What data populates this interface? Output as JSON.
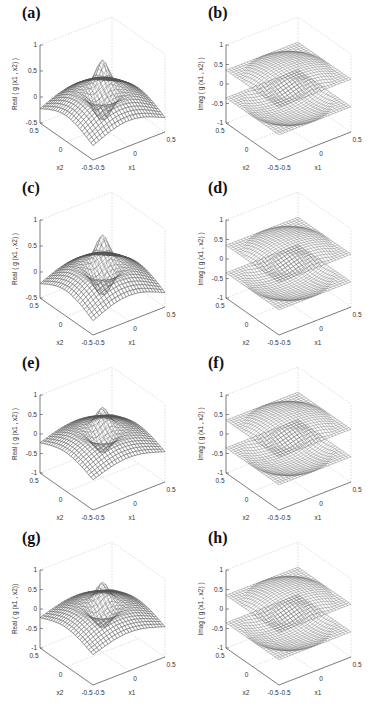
{
  "figure": {
    "panels": [
      {
        "id": "a",
        "label": "(a)",
        "zlabel": "Real ( g (x1 , x2) )",
        "kind": "real",
        "zticks": [
          "1",
          "0.5",
          "0",
          "-0.5"
        ],
        "zmin": -0.5,
        "zmax": 1,
        "x1label": "x1",
        "x2label": "x2",
        "x1ticks": [
          "-0.5",
          "0",
          "0.5"
        ],
        "x2ticks": [
          "0.5",
          "0",
          "-0.5"
        ]
      },
      {
        "id": "b",
        "label": "(b)",
        "zlabel": "Imag ( g (x1 , x2) )",
        "kind": "imag",
        "zticks": [
          "1",
          "0.5",
          "0",
          "-0.5",
          "-1"
        ],
        "zmin": -1,
        "zmax": 1,
        "x1label": "x1",
        "x2label": "x2",
        "x1ticks": [
          "-0.5",
          "0",
          "0.5"
        ],
        "x2ticks": [
          "0.5",
          "0",
          "-0.5"
        ]
      },
      {
        "id": "c",
        "label": "(c)",
        "zlabel": "Real ( g (x1 , x2) )",
        "kind": "real",
        "zticks": [
          "1",
          "0.5",
          "0",
          "-0.5"
        ],
        "zmin": -0.5,
        "zmax": 1,
        "x1label": "x1",
        "x2label": "x2",
        "x1ticks": [
          "-0.5",
          "0",
          "0.5"
        ],
        "x2ticks": [
          "0.5",
          "0",
          "-0.5"
        ]
      },
      {
        "id": "d",
        "label": "(d)",
        "zlabel": "Imag ( g (x1 , x2) )",
        "kind": "imag",
        "zticks": [
          "1",
          "0.5",
          "0",
          "-0.5",
          "-1"
        ],
        "zmin": -1,
        "zmax": 1,
        "x1label": "x1",
        "x2label": "x2",
        "x1ticks": [
          "-0.5",
          "0",
          "0.5"
        ],
        "x2ticks": [
          "0.5",
          "0",
          "-0.5"
        ]
      },
      {
        "id": "e",
        "label": "(e)",
        "zlabel": "Real ( g (x1 , x2) )",
        "kind": "real",
        "zticks": [
          "1",
          "0.5",
          "0",
          "-0.5",
          "-1"
        ],
        "zmin": -1,
        "zmax": 1,
        "x1label": "x1",
        "x2label": "x2",
        "x1ticks": [
          "-0.5",
          "0",
          "0.5"
        ],
        "x2ticks": [
          "0.5",
          "0",
          "-0.5"
        ]
      },
      {
        "id": "f",
        "label": "(f)",
        "zlabel": "Imag ( g (x1 , x2) )",
        "kind": "imag",
        "zticks": [
          "1",
          "0.5",
          "0",
          "-0.5",
          "-1"
        ],
        "zmin": -1,
        "zmax": 1,
        "x1label": "x1",
        "x2label": "x2",
        "x1ticks": [
          "-0.5",
          "0",
          "0.5"
        ],
        "x2ticks": [
          "0.5",
          "0",
          "-0.5"
        ]
      },
      {
        "id": "g",
        "label": "(g)",
        "zlabel": "Real ( g (x1 , x2))",
        "kind": "real",
        "zticks": [
          "1",
          "0.5",
          "0",
          "-0.5",
          "-1"
        ],
        "zmin": -1,
        "zmax": 1,
        "x1label": "x1",
        "x2label": "x2",
        "x1ticks": [
          "-0.5",
          "0",
          "0.5"
        ],
        "x2ticks": [
          "0.5",
          "0",
          "-0.5"
        ]
      },
      {
        "id": "h",
        "label": "(h)",
        "zlabel": "Imag ( g (x1 , x2) )",
        "kind": "imag",
        "zticks": [
          "1",
          "0.5",
          "0",
          "-0.5",
          "-1"
        ],
        "zmin": -1,
        "zmax": 1,
        "x1label": "x1",
        "x2label": "x2",
        "x1ticks": [
          "-0.5",
          "0",
          "0.5"
        ],
        "x2ticks": [
          "0.5",
          "0",
          "-0.5"
        ]
      }
    ]
  },
  "chart_data": [
    {
      "type": "surface3d",
      "title": "(a)",
      "xlabel": "x1",
      "ylabel": "x2",
      "zlabel": "Real ( g (x1 , x2) )",
      "xlim": [
        -0.5,
        0.5
      ],
      "ylim": [
        -0.5,
        0.5
      ],
      "zlim": [
        -0.5,
        1
      ],
      "xticks": [
        -0.5,
        0,
        0.5
      ],
      "yticks": [
        -0.5,
        0,
        0.5
      ],
      "zticks": [
        -0.5,
        0,
        0.5,
        1
      ],
      "grid": true,
      "description": "Mesh surface: dome ~0.3 at edges, central spike to ~0.8, central dip near -0.4"
    },
    {
      "type": "surface3d",
      "title": "(b)",
      "xlabel": "x1",
      "ylabel": "x2",
      "zlabel": "Imag ( g (x1 , x2) )",
      "xlim": [
        -0.5,
        0.5
      ],
      "ylim": [
        -0.5,
        0.5
      ],
      "zlim": [
        -1,
        1
      ],
      "xticks": [
        -0.5,
        0,
        0.5
      ],
      "yticks": [
        -0.5,
        0,
        0.5
      ],
      "zticks": [
        -1,
        -0.5,
        0,
        0.5,
        1
      ],
      "grid": true,
      "description": "Torus-like mesh surface spanning ~-0.7 to 0.6"
    },
    {
      "type": "surface3d",
      "title": "(c)",
      "xlabel": "x1",
      "ylabel": "x2",
      "zlabel": "Real ( g (x1 , x2) )",
      "xlim": [
        -0.5,
        0.5
      ],
      "ylim": [
        -0.5,
        0.5
      ],
      "zlim": [
        -0.5,
        1
      ],
      "xticks": [
        -0.5,
        0,
        0.5
      ],
      "yticks": [
        -0.5,
        0,
        0.5
      ],
      "zticks": [
        -0.5,
        0,
        0.5,
        1
      ],
      "grid": true,
      "description": "Mesh surface similar to (a) with central spike ~0.8"
    },
    {
      "type": "surface3d",
      "title": "(d)",
      "xlabel": "x1",
      "ylabel": "x2",
      "zlabel": "Imag ( g (x1 , x2) )",
      "xlim": [
        -0.5,
        0.5
      ],
      "ylim": [
        -0.5,
        0.5
      ],
      "zlim": [
        -1,
        1
      ],
      "xticks": [
        -0.5,
        0,
        0.5
      ],
      "yticks": [
        -0.5,
        0,
        0.5
      ],
      "zticks": [
        -1,
        -0.5,
        0,
        0.5,
        1
      ],
      "grid": true,
      "description": "Torus-like mesh surface"
    },
    {
      "type": "surface3d",
      "title": "(e)",
      "xlabel": "x1",
      "ylabel": "x2",
      "zlabel": "Real ( g (x1 , x2) )",
      "xlim": [
        -0.5,
        0.5
      ],
      "ylim": [
        -0.5,
        0.5
      ],
      "zlim": [
        -1,
        1
      ],
      "xticks": [
        -0.5,
        0,
        0.5
      ],
      "yticks": [
        -0.5,
        0,
        0.5
      ],
      "zticks": [
        -1,
        -0.5,
        0,
        0.5,
        1
      ],
      "grid": true,
      "description": "Flat top ~0.4 with central peak ~0.9 and deeper dip ~-0.8"
    },
    {
      "type": "surface3d",
      "title": "(f)",
      "xlabel": "x1",
      "ylabel": "x2",
      "zlabel": "Imag ( g (x1 , x2) )",
      "xlim": [
        -0.5,
        0.5
      ],
      "ylim": [
        -0.5,
        0.5
      ],
      "zlim": [
        -1,
        1
      ],
      "xticks": [
        -0.5,
        0,
        0.5
      ],
      "yticks": [
        -0.5,
        0,
        0.5
      ],
      "zticks": [
        -1,
        -0.5,
        0,
        0.5,
        1
      ],
      "grid": true,
      "description": "Cylinder-like torus mesh ~-0.8 to 0.5"
    },
    {
      "type": "surface3d",
      "title": "(g)",
      "xlabel": "x1",
      "ylabel": "x2",
      "zlabel": "Real ( g (x1 , x2))",
      "xlim": [
        -0.5,
        0.5
      ],
      "ylim": [
        -0.5,
        0.5
      ],
      "zlim": [
        -1,
        1
      ],
      "xticks": [
        -0.5,
        0,
        0.5
      ],
      "yticks": [
        -0.5,
        0,
        0.5
      ],
      "zticks": [
        -1,
        -0.5,
        0,
        0.5,
        1
      ],
      "grid": true,
      "description": "Dome surface with rounded central bump ~0.8 and dip ~-0.7"
    },
    {
      "type": "surface3d",
      "title": "(h)",
      "xlabel": "x1",
      "ylabel": "x2",
      "zlabel": "Imag ( g (x1 , x2) )",
      "xlim": [
        -0.5,
        0.5
      ],
      "ylim": [
        -0.5,
        0.5
      ],
      "zlim": [
        -1,
        1
      ],
      "xticks": [
        -0.5,
        0,
        0.5
      ],
      "yticks": [
        -0.5,
        0,
        0.5
      ],
      "zticks": [
        -1,
        -0.5,
        0,
        0.5,
        1
      ],
      "grid": true,
      "description": "Torus-like mesh surface"
    }
  ]
}
